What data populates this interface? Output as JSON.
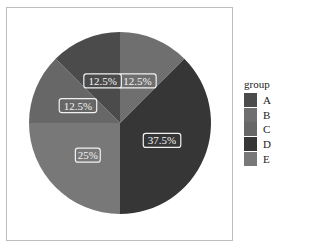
{
  "chart_data": {
    "type": "pie",
    "title": "",
    "legend_title": "group",
    "legend_position": "right",
    "categories": [
      "A",
      "B",
      "C",
      "D",
      "E"
    ],
    "values": [
      12.5,
      12.5,
      12.5,
      37.5,
      25
    ],
    "labels": [
      "12.5%",
      "12.5%",
      "12.5%",
      "37.5%",
      "25%"
    ],
    "colors": [
      "#4b4b4b",
      "#6f6f6f",
      "#676767",
      "#363636",
      "#787878"
    ],
    "start_angle": "12 o'clock",
    "direction": "clockwise",
    "draw_order": [
      "B",
      "D",
      "E",
      "C",
      "A"
    ]
  },
  "legend": {
    "title": "group",
    "items": [
      {
        "label": "A",
        "color": "#4b4b4b"
      },
      {
        "label": "B",
        "color": "#6f6f6f"
      },
      {
        "label": "C",
        "color": "#676767"
      },
      {
        "label": "D",
        "color": "#363636"
      },
      {
        "label": "E",
        "color": "#787878"
      }
    ]
  },
  "slices": [
    {
      "group": "B",
      "label": "12.5%",
      "color": "#6f6f6f"
    },
    {
      "group": "D",
      "label": "37.5%",
      "color": "#363636"
    },
    {
      "group": "E",
      "label": "25%",
      "color": "#787878"
    },
    {
      "group": "C",
      "label": "12.5%",
      "color": "#676767"
    },
    {
      "group": "A",
      "label": "12.5%",
      "color": "#4b4b4b"
    }
  ]
}
